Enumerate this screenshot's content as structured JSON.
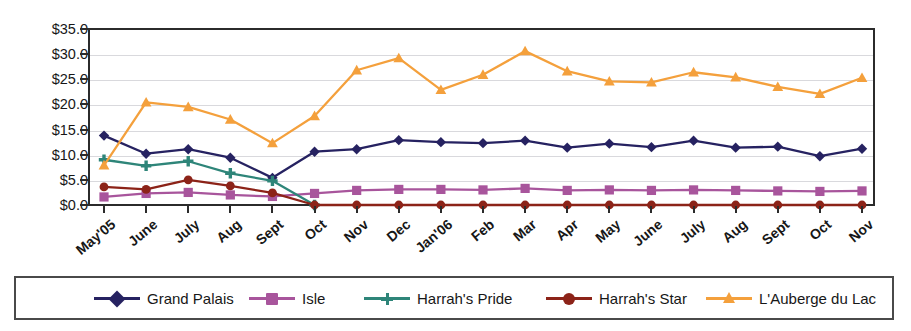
{
  "chart_data": {
    "type": "line",
    "title": "",
    "xlabel": "",
    "ylabel": "",
    "ylim": [
      0,
      35
    ],
    "ytick_values": [
      0,
      5,
      10,
      15,
      20,
      25,
      30,
      35
    ],
    "ytick_labels": [
      "$0.0",
      "$5.0",
      "$10.0",
      "$15.0",
      "$20.0",
      "$25.0",
      "$30.0",
      "$35.0"
    ],
    "grid": true,
    "legend_position": "bottom",
    "categories": [
      "May'05",
      "June",
      "July",
      "Aug",
      "Sept",
      "Oct",
      "Nov",
      "Dec",
      "Jan'06",
      "Feb",
      "Mar",
      "Apr",
      "May",
      "June",
      "July",
      "Aug",
      "Sept",
      "Oct",
      "Nov"
    ],
    "series": [
      {
        "name": "Grand Palais",
        "color": "#262261",
        "marker": "diamond",
        "values": [
          13.8,
          10.2,
          11.1,
          9.4,
          5.4,
          10.6,
          11.1,
          12.9,
          12.5,
          12.3,
          12.8,
          11.4,
          12.2,
          11.5,
          12.8,
          11.4,
          11.6,
          9.7,
          11.2
        ]
      },
      {
        "name": "Isle",
        "color": "#a8559c",
        "marker": "square",
        "values": [
          1.6,
          2.3,
          2.5,
          2.0,
          1.7,
          2.3,
          2.9,
          3.1,
          3.1,
          3.0,
          3.3,
          2.9,
          3.0,
          2.9,
          3.0,
          2.9,
          2.8,
          2.7,
          2.8
        ]
      },
      {
        "name": "Harrah's Pride",
        "color": "#2e8579",
        "marker": "plus",
        "values": [
          9.0,
          7.8,
          8.7,
          6.3,
          4.8,
          0.0,
          null,
          null,
          null,
          null,
          null,
          null,
          null,
          null,
          null,
          null,
          null,
          null,
          null
        ]
      },
      {
        "name": "Harrah's Star",
        "color": "#8c2318",
        "marker": "circle",
        "values": [
          3.6,
          3.1,
          5.0,
          3.8,
          2.4,
          0.0,
          0.0,
          0.0,
          0.0,
          0.0,
          0.0,
          0.0,
          0.0,
          0.0,
          0.0,
          0.0,
          0.0,
          0.0,
          0.0
        ]
      },
      {
        "name": "L'Auberge du Lac",
        "color": "#f4a03c",
        "marker": "triangle",
        "values": [
          7.9,
          20.4,
          19.5,
          17.0,
          12.3,
          17.7,
          26.8,
          29.2,
          22.9,
          25.9,
          30.6,
          26.6,
          24.6,
          24.4,
          26.4,
          25.4,
          23.5,
          22.1,
          25.3
        ]
      }
    ]
  },
  "legend": {
    "items": [
      {
        "label": "Grand Palais"
      },
      {
        "label": "Isle"
      },
      {
        "label": "Harrah's Pride"
      },
      {
        "label": "Harrah's Star"
      },
      {
        "label": "L'Auberge du Lac"
      }
    ]
  }
}
